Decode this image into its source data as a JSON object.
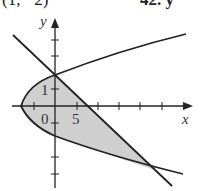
{
  "header": {
    "left_text": "(1, −2)",
    "right_text": "42. y"
  },
  "figure": {
    "x_axis_label": "x",
    "y_axis_label": "y",
    "origin_label": "0",
    "x_tick_label": "5",
    "y_tick_label": "1",
    "shade_color": "#cfcfcf",
    "curve_color": "#222222"
  }
}
